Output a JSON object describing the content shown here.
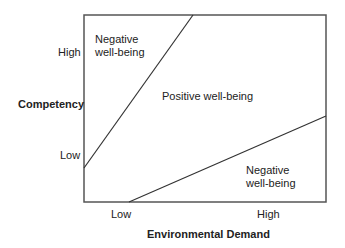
{
  "diagram": {
    "type": "two-dimensional region diagram",
    "y_axis": {
      "label": "Competency",
      "ticks": [
        "High",
        "Low"
      ]
    },
    "x_axis": {
      "label": "Environmental Demand",
      "ticks": [
        "Low",
        "High"
      ]
    },
    "regions": [
      {
        "id": "upper-left",
        "label_line1": "Negative",
        "label_line2": "well-being"
      },
      {
        "id": "middle",
        "label": "Positive well-being"
      },
      {
        "id": "lower-right",
        "label_line1": "Negative",
        "label_line2": "well-being"
      }
    ],
    "colors": {
      "line": "#333333",
      "text": "#222222",
      "background": "#ffffff"
    }
  }
}
